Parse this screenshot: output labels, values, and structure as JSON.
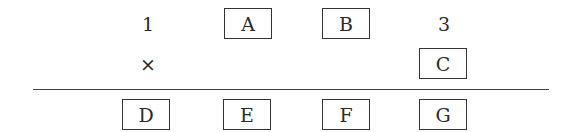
{
  "problem": {
    "type": "multiplication-cryptarithm",
    "row1": [
      {
        "kind": "digit",
        "value": "1"
      },
      {
        "kind": "box",
        "value": "A"
      },
      {
        "kind": "box",
        "value": "B"
      },
      {
        "kind": "digit",
        "value": "3"
      }
    ],
    "row2": {
      "operator": "×",
      "multiplier": {
        "kind": "box",
        "value": "C"
      }
    },
    "result": [
      {
        "kind": "box",
        "value": "D"
      },
      {
        "kind": "box",
        "value": "E"
      },
      {
        "kind": "box",
        "value": "F"
      },
      {
        "kind": "box",
        "value": "G"
      }
    ]
  }
}
